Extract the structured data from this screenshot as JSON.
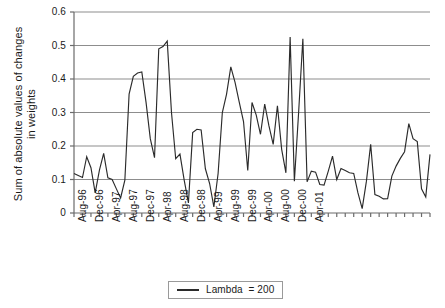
{
  "chart_data": {
    "type": "line",
    "title": "",
    "xlabel": "",
    "ylabel": "Sum of absolute values of changes in weights",
    "ylabel_lines": [
      "Sum of absolute values of changes",
      "in weights"
    ],
    "ylim": [
      0,
      0.6
    ],
    "ytick_labels": [
      "0.6",
      "0.5",
      "0.4",
      "0.3",
      "0.2",
      "0.1",
      "0"
    ],
    "ytick_values": [
      0.6,
      0.5,
      0.4,
      0.3,
      0.2,
      0.1,
      0
    ],
    "grid": true,
    "grid_axis": "y",
    "legend": [
      "Lambda  = 200"
    ],
    "legend_position": "bottom",
    "line_color": "#2b2b2b",
    "xtick_labels": [
      "Aug-96",
      "Dec-96",
      "Apr-97",
      "Aug-97",
      "Dec-97",
      "Apr-98",
      "Aug-98",
      "Dec-98",
      "Apr-99",
      "Aug-99",
      "Dec-99",
      "Apr-00",
      "Aug-00",
      "Dec-00",
      "Apr-01"
    ],
    "xtick_interval_months": 4,
    "minor_tick_interval_months": 2,
    "x_start": "Aug-96",
    "series": [
      {
        "name": "Lambda  = 200",
        "values": [
          0.118,
          0.112,
          0.106,
          0.168,
          0.135,
          0.06,
          0.128,
          0.178,
          0.105,
          0.1,
          0.072,
          0.045,
          0.098,
          0.355,
          0.408,
          0.418,
          0.421,
          0.33,
          0.222,
          0.165,
          0.49,
          0.497,
          0.513,
          0.3,
          0.162,
          0.176,
          0.098,
          0.03,
          0.24,
          0.25,
          0.248,
          0.132,
          0.088,
          0.018,
          0.118,
          0.3,
          0.355,
          0.436,
          0.39,
          0.33,
          0.273,
          0.127,
          0.33,
          0.292,
          0.235,
          0.325,
          0.26,
          0.205,
          0.32,
          0.19,
          0.12,
          0.525,
          0.095,
          0.3,
          0.52,
          0.093,
          0.125,
          0.122,
          0.085,
          0.083,
          0.125,
          0.17,
          0.1,
          0.133,
          0.127,
          0.12,
          0.118,
          0.06,
          0.013,
          0.095,
          0.205,
          0.055,
          0.05,
          0.042,
          0.043,
          0.11,
          0.14,
          0.163,
          0.183,
          0.267,
          0.222,
          0.213,
          0.072,
          0.048,
          0.175
        ]
      }
    ]
  }
}
